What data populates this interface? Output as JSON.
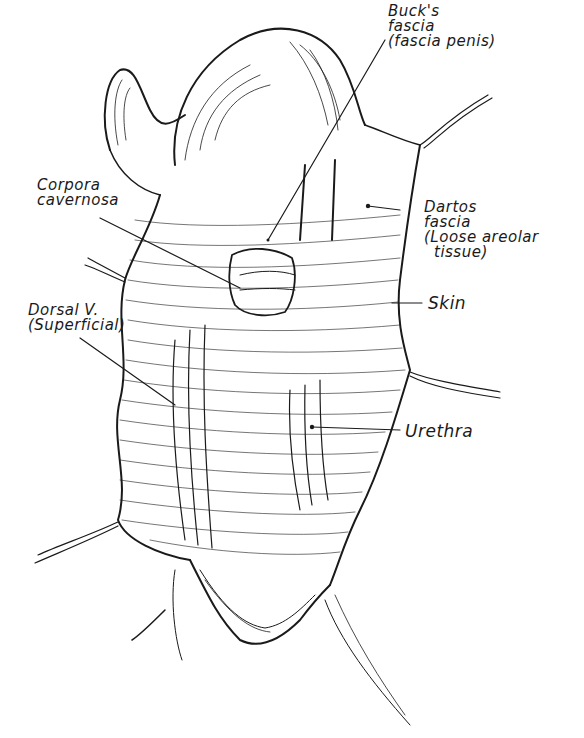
{
  "figure": {
    "ink_color": "#1a1a1a",
    "background": "#ffffff"
  },
  "labels": {
    "bucks_fascia": {
      "line1": "Buck's",
      "line2": "fascia",
      "line3": "(fascia penis)"
    },
    "corpora_cavernosa": {
      "line1": "Corpora",
      "line2": "cavernosa"
    },
    "dartos_fascia": {
      "line1": "Dartos",
      "line2": "fascia",
      "line3": "(Loose areolar",
      "line4": "tissue)"
    },
    "skin": {
      "line1": "Skin"
    },
    "dorsal_v": {
      "line1": "Dorsal V.",
      "line2": "(Superficial)"
    },
    "urethra": {
      "line1": "Urethra"
    }
  }
}
